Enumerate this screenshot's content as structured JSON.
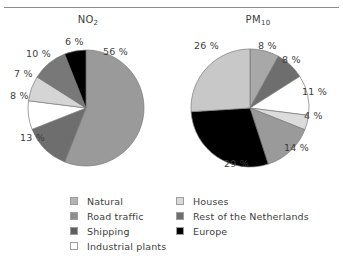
{
  "figure": {
    "top_rule": true
  },
  "charts": [
    {
      "id": "no2",
      "title_main": "NO",
      "title_sub": "2",
      "title_full": "NO2"
    },
    {
      "id": "pm10",
      "title_main": "PM",
      "title_sub": "10",
      "title_full": "PM10"
    }
  ],
  "legend": {
    "columns": [
      {
        "items": [
          {
            "label": "Natural",
            "color": "#b4b4b4"
          },
          {
            "label": "Road traffic",
            "color": "#8f8f8f"
          },
          {
            "label": "Shipping",
            "color": "#5e5e5e"
          },
          {
            "label": "Industrial plants",
            "color": "#ffffff"
          }
        ]
      },
      {
        "items": [
          {
            "label": "Houses",
            "color": "#d9d9d9"
          },
          {
            "label": "Rest of the Netherlands",
            "color": "#6e6e6e"
          },
          {
            "label": "Europe",
            "color": "#000000"
          }
        ]
      }
    ]
  },
  "chart_data": [
    {
      "type": "pie",
      "title": "NO2",
      "id": "no2",
      "unit": "%",
      "start_angle_deg": 0,
      "direction": "clockwise",
      "categories": [
        "Natural",
        "Road traffic",
        "Industrial plants",
        "Houses",
        "Rest of the Netherlands",
        "Europe"
      ],
      "values": [
        56,
        13,
        8,
        7,
        10,
        6
      ],
      "colors": [
        "#9a9a9a",
        "#6e6e6e",
        "#ffffff",
        "#d5d5d5",
        "#787878",
        "#000000"
      ],
      "labels": [
        "56 %",
        "13 %",
        "8 %",
        "7 %",
        "10 %",
        "6 %"
      ],
      "legend_position": "bottom"
    },
    {
      "type": "pie",
      "title": "PM10",
      "id": "pm10",
      "unit": "%",
      "start_angle_deg": 0,
      "direction": "clockwise",
      "categories": [
        "Natural",
        "Rest of the Netherlands",
        "Industrial plants",
        "Houses",
        "Road traffic",
        "Europe",
        "Shipping"
      ],
      "values": [
        8,
        8,
        11,
        4,
        14,
        29,
        26
      ],
      "colors": [
        "#a8a8a8",
        "#6e6e6e",
        "#ffffff",
        "#dcdcdc",
        "#9a9a9a",
        "#000000",
        "#c8c8c8"
      ],
      "labels": [
        "8 %",
        "8 %",
        "11 %",
        "4 %",
        "14 %",
        "29 %",
        "26 %"
      ],
      "legend_position": "bottom"
    }
  ],
  "labels_no2": [
    {
      "text": "56 %",
      "x": 95,
      "y": 10
    },
    {
      "text": "6 %",
      "x": 57,
      "y": 0
    },
    {
      "text": "10 %",
      "x": 18,
      "y": 12
    },
    {
      "text": "7 %",
      "x": 6,
      "y": 32
    },
    {
      "text": "8 %",
      "x": 2,
      "y": 54
    },
    {
      "text": "13 %",
      "x": 12,
      "y": 96
    }
  ],
  "labels_pm10": [
    {
      "text": "8 %",
      "x": 80,
      "y": 4
    },
    {
      "text": "8 %",
      "x": 104,
      "y": 18
    },
    {
      "text": "11 %",
      "x": 124,
      "y": 50
    },
    {
      "text": "4 %",
      "x": 126,
      "y": 74
    },
    {
      "text": "14 %",
      "x": 106,
      "y": 106
    },
    {
      "text": "29 %",
      "x": 46,
      "y": 122
    },
    {
      "text": "26 %",
      "x": 16,
      "y": 4
    }
  ]
}
